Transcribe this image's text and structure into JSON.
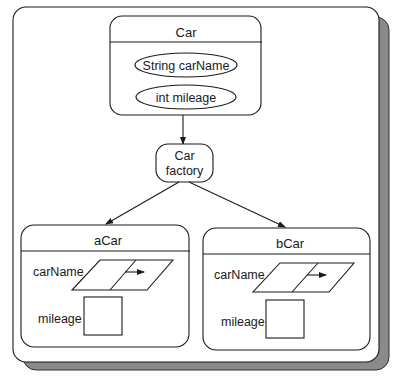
{
  "diagram": {
    "class_box": {
      "title": "Car",
      "attributes": [
        {
          "label": "String carName"
        },
        {
          "label": "int mileage"
        }
      ]
    },
    "factory": {
      "line1": "Car",
      "line2": "factory"
    },
    "instances": [
      {
        "title": "aCar",
        "fields": [
          {
            "label": "carName",
            "type": "reference"
          },
          {
            "label": "mileage",
            "type": "value"
          }
        ]
      },
      {
        "title": "bCar",
        "fields": [
          {
            "label": "carName",
            "type": "reference"
          },
          {
            "label": "mileage",
            "type": "value"
          }
        ]
      }
    ],
    "edges": [
      {
        "from": "Car",
        "to": "Car factory"
      },
      {
        "from": "Car factory",
        "to": "aCar"
      },
      {
        "from": "Car factory",
        "to": "bCar"
      }
    ],
    "colors": {
      "line": "#1a1a1a",
      "shadow": "#8a8a8a",
      "background": "#ffffff"
    }
  }
}
